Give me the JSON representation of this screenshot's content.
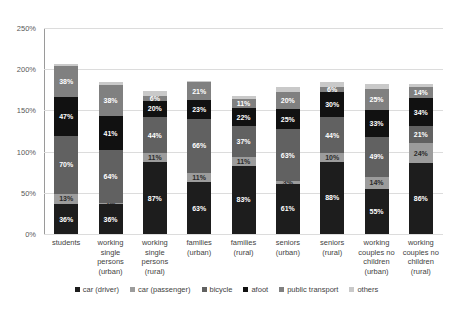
{
  "chart_data": {
    "type": "bar",
    "stacked": true,
    "title": "",
    "xlabel": "",
    "ylabel": "",
    "ylim": [
      0,
      250
    ],
    "ytick_labels": [
      "0%",
      "50%",
      "100%",
      "150%",
      "200%",
      "250%"
    ],
    "ytick_values": [
      0,
      50,
      100,
      150,
      200,
      250
    ],
    "grid": true,
    "legend_position": "bottom",
    "categories": [
      "students",
      "working single persons (urban)",
      "working single persons (rural)",
      "families (urban)",
      "families (rural)",
      "seniors (urban)",
      "seniors (rural)",
      "working couples no children (urban)",
      "working couples no children (rural)"
    ],
    "category_lines": [
      [
        "students"
      ],
      [
        "working",
        "single",
        "persons",
        "(urban)"
      ],
      [
        "working",
        "single",
        "persons",
        "(rural)"
      ],
      [
        "families",
        "(urban)"
      ],
      [
        "families",
        "(rural)"
      ],
      [
        "seniors",
        "(urban)"
      ],
      [
        "seniors",
        "(rural)"
      ],
      [
        "working",
        "couples no",
        "children",
        "(urban)"
      ],
      [
        "working",
        "couples no",
        "children",
        "(rural)"
      ]
    ],
    "series": [
      {
        "name": "car (driver)",
        "color": "#1d1d1d",
        "values": [
          36,
          36,
          87,
          63,
          83,
          61,
          88,
          55,
          86
        ]
      },
      {
        "name": "car (passenger)",
        "color": "#9c9c9c",
        "values": [
          13,
          2,
          11,
          11,
          11,
          3,
          10,
          14,
          24
        ]
      },
      {
        "name": "bicycle",
        "color": "#616161",
        "values": [
          70,
          64,
          44,
          66,
          37,
          63,
          44,
          49,
          21
        ]
      },
      {
        "name": "afoot",
        "color": "#111111",
        "values": [
          47,
          41,
          20,
          23,
          22,
          25,
          30,
          33,
          34
        ]
      },
      {
        "name": "public transport",
        "color": "#808080",
        "values": [
          38,
          38,
          6,
          21,
          11,
          20,
          6,
          25,
          14
        ]
      },
      {
        "name": "others",
        "color": "#c9c9c9",
        "values": [
          2,
          4,
          6,
          2,
          3,
          7,
          6,
          6,
          3
        ]
      }
    ],
    "bar_totals": [
      206,
      185,
      174,
      186,
      167,
      179,
      184,
      182,
      182
    ],
    "value_labels": [
      [
        "36%",
        "13%",
        "70%",
        "47%",
        "38%",
        "2%"
      ],
      [
        "36%",
        "2%",
        "64%",
        "41%",
        "38%",
        "4%"
      ],
      [
        "87%",
        "11%",
        "44%",
        "20%",
        "6%",
        "6%"
      ],
      [
        "63%",
        "11%",
        "66%",
        "23%",
        "21%",
        "2%"
      ],
      [
        "83%",
        "11%",
        "37%",
        "22%",
        "11%",
        "3%"
      ],
      [
        "61%",
        "3%",
        "63%",
        "25%",
        "20%",
        "7%"
      ],
      [
        "88%",
        "10%",
        "44%",
        "30%",
        "6%",
        "6%"
      ],
      [
        "55%",
        "14%",
        "49%",
        "33%",
        "25%",
        "6%"
      ],
      [
        "86%",
        "24%",
        "21%",
        "34%",
        "14%",
        "3%"
      ]
    ]
  },
  "legend": {
    "items": [
      {
        "label": "car (driver)",
        "color": "#1d1d1d"
      },
      {
        "label": "car (passenger)",
        "color": "#9c9c9c"
      },
      {
        "label": "bicycle",
        "color": "#616161"
      },
      {
        "label": "afoot",
        "color": "#111111"
      },
      {
        "label": "public transport",
        "color": "#808080"
      },
      {
        "label": "others",
        "color": "#c9c9c9"
      }
    ]
  }
}
